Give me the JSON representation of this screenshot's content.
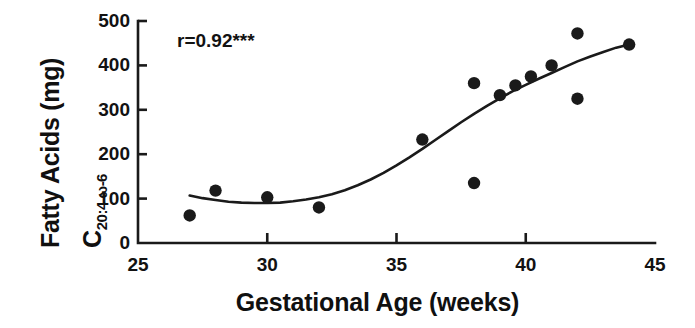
{
  "chart_data": {
    "type": "scatter",
    "title": "",
    "xlabel": "Gestational Age (weeks)",
    "ylabel_line1": "Fatty Acids (mg)",
    "ylabel_line2_main": "C",
    "ylabel_line2_sub": "20:4 ω-6",
    "xlim": [
      25,
      45
    ],
    "ylim": [
      0,
      500
    ],
    "xticks": [
      25,
      30,
      35,
      40,
      45
    ],
    "xticklabels": [
      "25",
      "30",
      "35",
      "40",
      "45"
    ],
    "yticks": [
      0,
      100,
      200,
      300,
      400,
      500
    ],
    "yticklabels": [
      "0",
      "100",
      "200",
      "300",
      "400",
      "500"
    ],
    "x_minor_ticks": [],
    "grid": false,
    "legend": null,
    "annotation": "r=0.92***",
    "annotation_x": 27.2,
    "annotation_y": 455,
    "marker": "filled-circle",
    "marker_color": "#1a1a1a",
    "points": [
      {
        "x": 27.0,
        "y": 62
      },
      {
        "x": 28.0,
        "y": 118
      },
      {
        "x": 30.0,
        "y": 103
      },
      {
        "x": 32.0,
        "y": 80
      },
      {
        "x": 36.0,
        "y": 233
      },
      {
        "x": 38.0,
        "y": 360
      },
      {
        "x": 38.0,
        "y": 135
      },
      {
        "x": 39.0,
        "y": 333
      },
      {
        "x": 39.6,
        "y": 355
      },
      {
        "x": 40.2,
        "y": 375
      },
      {
        "x": 41.0,
        "y": 400
      },
      {
        "x": 42.0,
        "y": 472
      },
      {
        "x": 42.0,
        "y": 325
      },
      {
        "x": 44.0,
        "y": 447
      }
    ],
    "fit_curve": {
      "name": "sigmoid-fit",
      "points": [
        {
          "x": 27.0,
          "y": 107
        },
        {
          "x": 27.5,
          "y": 101
        },
        {
          "x": 28.0,
          "y": 97
        },
        {
          "x": 28.5,
          "y": 93
        },
        {
          "x": 29.0,
          "y": 91
        },
        {
          "x": 29.5,
          "y": 90
        },
        {
          "x": 30.0,
          "y": 90
        },
        {
          "x": 30.5,
          "y": 91
        },
        {
          "x": 31.0,
          "y": 94
        },
        {
          "x": 31.5,
          "y": 98
        },
        {
          "x": 32.0,
          "y": 103
        },
        {
          "x": 32.5,
          "y": 110
        },
        {
          "x": 33.0,
          "y": 119
        },
        {
          "x": 33.5,
          "y": 130
        },
        {
          "x": 34.0,
          "y": 143
        },
        {
          "x": 34.5,
          "y": 158
        },
        {
          "x": 35.0,
          "y": 175
        },
        {
          "x": 35.5,
          "y": 193
        },
        {
          "x": 36.0,
          "y": 212
        },
        {
          "x": 36.5,
          "y": 232
        },
        {
          "x": 37.0,
          "y": 252
        },
        {
          "x": 37.5,
          "y": 272
        },
        {
          "x": 38.0,
          "y": 291
        },
        {
          "x": 38.5,
          "y": 309
        },
        {
          "x": 39.0,
          "y": 326
        },
        {
          "x": 39.5,
          "y": 342
        },
        {
          "x": 40.0,
          "y": 356
        },
        {
          "x": 40.5,
          "y": 370
        },
        {
          "x": 41.0,
          "y": 383
        },
        {
          "x": 41.5,
          "y": 396
        },
        {
          "x": 42.0,
          "y": 409
        },
        {
          "x": 42.5,
          "y": 420
        },
        {
          "x": 43.0,
          "y": 430
        },
        {
          "x": 43.5,
          "y": 440
        },
        {
          "x": 44.0,
          "y": 447
        }
      ]
    }
  }
}
